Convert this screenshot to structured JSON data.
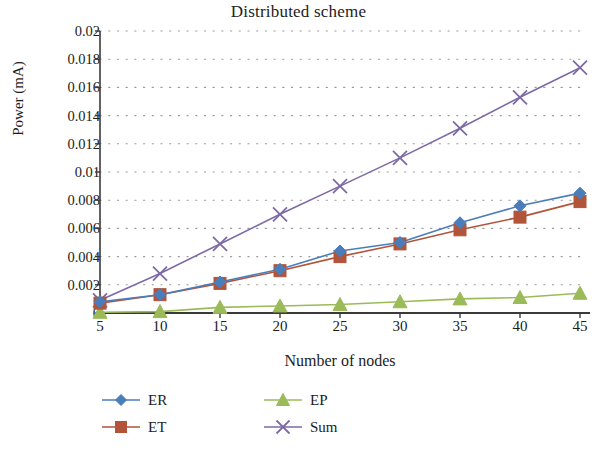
{
  "chart_data": {
    "type": "line",
    "title": "Distributed scheme",
    "xlabel": "Number of nodes",
    "ylabel": "Power (mA)",
    "categories": [
      5,
      10,
      15,
      20,
      25,
      30,
      35,
      40,
      45
    ],
    "x": [
      5,
      10,
      15,
      20,
      25,
      30,
      35,
      40,
      45
    ],
    "xlim": [
      5,
      45
    ],
    "ylim": [
      0,
      0.02
    ],
    "xticks": [
      "5",
      "10",
      "15",
      "20",
      "25",
      "30",
      "35",
      "40",
      "45"
    ],
    "yticks": [
      "0",
      "0.002",
      "0.004",
      "0.006",
      "0.008",
      "0.01",
      "0.012",
      "0.014",
      "0.016",
      "0.018",
      "0.02"
    ],
    "ytick_values": [
      0,
      0.002,
      0.004,
      0.006,
      0.008,
      0.01,
      0.012,
      0.014,
      0.016,
      0.018,
      0.02
    ],
    "grid": "horizontal-dotted",
    "legend_position": "bottom",
    "series": [
      {
        "name": "ER",
        "color": "#4a7ebb",
        "marker": "diamond",
        "values": [
          0.0008,
          0.0013,
          0.0022,
          0.0031,
          0.0044,
          0.005,
          0.0064,
          0.0076,
          0.0085
        ]
      },
      {
        "name": "ET",
        "color": "#b1543a",
        "marker": "square",
        "values": [
          0.0007,
          0.0013,
          0.0021,
          0.003,
          0.004,
          0.0049,
          0.0059,
          0.0068,
          0.0079
        ]
      },
      {
        "name": "EP",
        "color": "#9bbb59",
        "marker": "triangle",
        "values": [
          5e-05,
          0.0001,
          0.0004,
          0.0005,
          0.0006,
          0.0008,
          0.001,
          0.0011,
          0.0014
        ]
      },
      {
        "name": "Sum",
        "color": "#7d6aa5",
        "marker": "cross",
        "values": [
          0.0009,
          0.0028,
          0.0049,
          0.007,
          0.009,
          0.011,
          0.0131,
          0.0153,
          0.0174
        ]
      }
    ]
  },
  "axes": {
    "axis_color": "#3a3a3a",
    "grid_color": "#9a9a9a"
  }
}
